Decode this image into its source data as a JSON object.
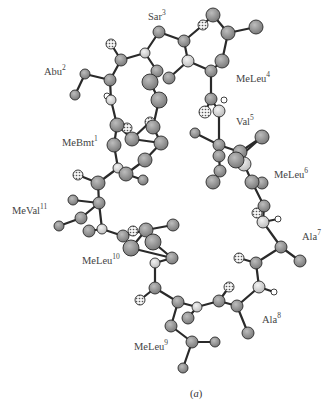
{
  "figure": {
    "caption_letter": "a",
    "caption_pos": [
      190,
      388
    ]
  },
  "colors": {
    "bond": "#2a2a2a",
    "carbon_fill": "#8c8c8c",
    "nitrogen_fill": "#d6d6d6",
    "oxygen_fill": "#f2f2f2",
    "hydrogen_fill": "#ffffff",
    "outline": "#2a2a2a",
    "label": "#444444"
  },
  "labels": [
    {
      "name": "Sar",
      "num": "3",
      "x": 148,
      "y": 12
    },
    {
      "name": "Abu",
      "num": "2",
      "x": 44,
      "y": 67
    },
    {
      "name": "MeLeu",
      "num": "4",
      "x": 236,
      "y": 74
    },
    {
      "name": "Val",
      "num": "5",
      "x": 236,
      "y": 117
    },
    {
      "name": "MeBmt",
      "num": "1",
      "x": 62,
      "y": 138
    },
    {
      "name": "MeLeu",
      "num": "6",
      "x": 274,
      "y": 170
    },
    {
      "name": "MeVal",
      "num": "11",
      "x": 12,
      "y": 206
    },
    {
      "name": "Ala",
      "num": "7",
      "x": 302,
      "y": 232
    },
    {
      "name": "MeLeu",
      "num": "10",
      "x": 82,
      "y": 256
    },
    {
      "name": "Ala",
      "num": "8",
      "x": 262,
      "y": 315
    },
    {
      "name": "MeLeu",
      "num": "9",
      "x": 134,
      "y": 342
    }
  ],
  "atoms": [
    {
      "id": "a1",
      "x": 159,
      "y": 32,
      "r": 6,
      "t": "C"
    },
    {
      "id": "a2",
      "x": 184,
      "y": 41,
      "r": 6,
      "t": "C"
    },
    {
      "id": "a3",
      "x": 203,
      "y": 25,
      "r": 5,
      "t": "O"
    },
    {
      "id": "a4",
      "x": 213,
      "y": 15,
      "r": 7,
      "t": "C"
    },
    {
      "id": "a5",
      "x": 228,
      "y": 33,
      "r": 7,
      "t": "C"
    },
    {
      "id": "a6",
      "x": 256,
      "y": 27,
      "r": 7,
      "t": "C"
    },
    {
      "id": "a7",
      "x": 222,
      "y": 61,
      "r": 7,
      "t": "C"
    },
    {
      "id": "a8",
      "x": 188,
      "y": 61,
      "r": 6,
      "t": "N"
    },
    {
      "id": "a9",
      "x": 169,
      "y": 78,
      "r": 6,
      "t": "C"
    },
    {
      "id": "a10",
      "x": 211,
      "y": 71,
      "r": 6,
      "t": "C"
    },
    {
      "id": "a11",
      "x": 145,
      "y": 53,
      "r": 5,
      "t": "N"
    },
    {
      "id": "a12",
      "x": 121,
      "y": 60,
      "r": 6,
      "t": "C"
    },
    {
      "id": "a13",
      "x": 111,
      "y": 44,
      "r": 5,
      "t": "O"
    },
    {
      "id": "a14",
      "x": 157,
      "y": 71,
      "r": 6,
      "t": "C"
    },
    {
      "id": "a15",
      "x": 150,
      "y": 82,
      "r": 8,
      "t": "C"
    },
    {
      "id": "a16",
      "x": 159,
      "y": 100,
      "r": 8,
      "t": "C"
    },
    {
      "id": "a17",
      "x": 110,
      "y": 80,
      "r": 6,
      "t": "C"
    },
    {
      "id": "a18",
      "x": 85,
      "y": 74,
      "r": 5,
      "t": "C"
    },
    {
      "id": "a19",
      "x": 75,
      "y": 95,
      "r": 5,
      "t": "C"
    },
    {
      "id": "a20",
      "x": 111,
      "y": 100,
      "r": 5,
      "t": "N"
    },
    {
      "id": "a21",
      "x": 107,
      "y": 96,
      "r": 3,
      "t": "H"
    },
    {
      "id": "a22",
      "x": 211,
      "y": 99,
      "r": 6,
      "t": "C"
    },
    {
      "id": "a23",
      "x": 205,
      "y": 112,
      "r": 6,
      "t": "O"
    },
    {
      "id": "a24",
      "x": 219,
      "y": 111,
      "r": 6,
      "t": "N"
    },
    {
      "id": "a25",
      "x": 224,
      "y": 100,
      "r": 3,
      "t": "H"
    },
    {
      "id": "a26",
      "x": 117,
      "y": 125,
      "r": 7,
      "t": "C"
    },
    {
      "id": "a27",
      "x": 127,
      "y": 128,
      "r": 5,
      "t": "O"
    },
    {
      "id": "a28",
      "x": 150,
      "y": 122,
      "r": 5,
      "t": "O"
    },
    {
      "id": "a29",
      "x": 153,
      "y": 127,
      "r": 7,
      "t": "C"
    },
    {
      "id": "a30",
      "x": 114,
      "y": 145,
      "r": 7,
      "t": "C"
    },
    {
      "id": "a31",
      "x": 132,
      "y": 139,
      "r": 7,
      "t": "C"
    },
    {
      "id": "a32",
      "x": 161,
      "y": 143,
      "r": 7,
      "t": "C"
    },
    {
      "id": "a33",
      "x": 145,
      "y": 160,
      "r": 7,
      "t": "C"
    },
    {
      "id": "a34",
      "x": 118,
      "y": 168,
      "r": 5,
      "t": "N"
    },
    {
      "id": "a35",
      "x": 126,
      "y": 174,
      "r": 7,
      "t": "C"
    },
    {
      "id": "a36",
      "x": 143,
      "y": 180,
      "r": 5,
      "t": "C"
    },
    {
      "id": "a37",
      "x": 98,
      "y": 183,
      "r": 7,
      "t": "C"
    },
    {
      "id": "a38",
      "x": 78,
      "y": 175,
      "r": 5,
      "t": "O"
    },
    {
      "id": "a39",
      "x": 99,
      "y": 203,
      "r": 6,
      "t": "C"
    },
    {
      "id": "a40",
      "x": 73,
      "y": 200,
      "r": 5,
      "t": "C"
    },
    {
      "id": "a41",
      "x": 81,
      "y": 218,
      "r": 6,
      "t": "C"
    },
    {
      "id": "a42",
      "x": 59,
      "y": 226,
      "r": 5,
      "t": "C"
    },
    {
      "id": "a43",
      "x": 102,
      "y": 229,
      "r": 5,
      "t": "N"
    },
    {
      "id": "a44",
      "x": 89,
      "y": 231,
      "r": 6,
      "t": "C"
    },
    {
      "id": "a45",
      "x": 123,
      "y": 236,
      "r": 6,
      "t": "C"
    },
    {
      "id": "a46",
      "x": 133,
      "y": 231,
      "r": 5,
      "t": "O"
    },
    {
      "id": "a47",
      "x": 146,
      "y": 230,
      "r": 7,
      "t": "C"
    },
    {
      "id": "a48",
      "x": 131,
      "y": 248,
      "r": 8,
      "t": "C"
    },
    {
      "id": "a49",
      "x": 153,
      "y": 242,
      "r": 8,
      "t": "C"
    },
    {
      "id": "a50",
      "x": 173,
      "y": 225,
      "r": 6,
      "t": "C"
    },
    {
      "id": "a51",
      "x": 172,
      "y": 258,
      "r": 6,
      "t": "C"
    },
    {
      "id": "a52",
      "x": 155,
      "y": 263,
      "r": 5,
      "t": "N"
    },
    {
      "id": "a53",
      "x": 155,
      "y": 288,
      "r": 6,
      "t": "C"
    },
    {
      "id": "a54",
      "x": 140,
      "y": 300,
      "r": 5,
      "t": "O"
    },
    {
      "id": "a55",
      "x": 178,
      "y": 302,
      "r": 6,
      "t": "C"
    },
    {
      "id": "a56",
      "x": 171,
      "y": 326,
      "r": 6,
      "t": "C"
    },
    {
      "id": "a57",
      "x": 192,
      "y": 342,
      "r": 6,
      "t": "C"
    },
    {
      "id": "a58",
      "x": 215,
      "y": 342,
      "r": 5,
      "t": "C"
    },
    {
      "id": "a59",
      "x": 183,
      "y": 368,
      "r": 5,
      "t": "C"
    },
    {
      "id": "a60",
      "x": 197,
      "y": 307,
      "r": 5,
      "t": "N"
    },
    {
      "id": "a61",
      "x": 188,
      "y": 318,
      "r": 6,
      "t": "C"
    },
    {
      "id": "a62",
      "x": 219,
      "y": 301,
      "r": 6,
      "t": "C"
    },
    {
      "id": "a63",
      "x": 229,
      "y": 287,
      "r": 5,
      "t": "O"
    },
    {
      "id": "a64",
      "x": 237,
      "y": 306,
      "r": 6,
      "t": "C"
    },
    {
      "id": "a65",
      "x": 248,
      "y": 333,
      "r": 6,
      "t": "C"
    },
    {
      "id": "a66",
      "x": 259,
      "y": 287,
      "r": 6,
      "t": "N"
    },
    {
      "id": "a67",
      "x": 274,
      "y": 292,
      "r": 3,
      "t": "H"
    },
    {
      "id": "a68",
      "x": 256,
      "y": 263,
      "r": 6,
      "t": "C"
    },
    {
      "id": "a69",
      "x": 239,
      "y": 258,
      "r": 5,
      "t": "O"
    },
    {
      "id": "a70",
      "x": 281,
      "y": 247,
      "r": 6,
      "t": "C"
    },
    {
      "id": "a71",
      "x": 300,
      "y": 261,
      "r": 6,
      "t": "C"
    },
    {
      "id": "a72",
      "x": 263,
      "y": 222,
      "r": 6,
      "t": "N"
    },
    {
      "id": "a73",
      "x": 278,
      "y": 219,
      "r": 3,
      "t": "H"
    },
    {
      "id": "a74",
      "x": 264,
      "y": 206,
      "r": 6,
      "t": "C"
    },
    {
      "id": "a75",
      "x": 257,
      "y": 213,
      "r": 5,
      "t": "O"
    },
    {
      "id": "a76",
      "x": 252,
      "y": 182,
      "r": 7,
      "t": "C"
    },
    {
      "id": "a77",
      "x": 262,
      "y": 183,
      "r": 6,
      "t": "C"
    },
    {
      "id": "a78",
      "x": 219,
      "y": 145,
      "r": 6,
      "t": "C"
    },
    {
      "id": "a79",
      "x": 195,
      "y": 133,
      "r": 5,
      "t": "C"
    },
    {
      "id": "a80",
      "x": 262,
      "y": 137,
      "r": 7,
      "t": "C"
    },
    {
      "id": "a81",
      "x": 240,
      "y": 152,
      "r": 7,
      "t": "C"
    },
    {
      "id": "a82",
      "x": 244,
      "y": 164,
      "r": 7,
      "t": "N"
    },
    {
      "id": "a83",
      "x": 236,
      "y": 160,
      "r": 8,
      "t": "C"
    },
    {
      "id": "a84",
      "x": 220,
      "y": 171,
      "r": 6,
      "t": "C"
    },
    {
      "id": "a85",
      "x": 213,
      "y": 182,
      "r": 7,
      "t": "C"
    },
    {
      "id": "a86",
      "x": 219,
      "y": 156,
      "r": 6,
      "t": "C"
    }
  ],
  "bonds": [
    [
      "a1",
      "a2"
    ],
    [
      "a2",
      "a3"
    ],
    [
      "a3",
      "a4"
    ],
    [
      "a4",
      "a5"
    ],
    [
      "a5",
      "a6"
    ],
    [
      "a5",
      "a7"
    ],
    [
      "a7",
      "a10"
    ],
    [
      "a2",
      "a8"
    ],
    [
      "a8",
      "a9"
    ],
    [
      "a8",
      "a10"
    ],
    [
      "a1",
      "a11"
    ],
    [
      "a11",
      "a12"
    ],
    [
      "a12",
      "a13"
    ],
    [
      "a11",
      "a14"
    ],
    [
      "a14",
      "a15"
    ],
    [
      "a15",
      "a16"
    ],
    [
      "a12",
      "a17"
    ],
    [
      "a17",
      "a18"
    ],
    [
      "a18",
      "a19"
    ],
    [
      "a17",
      "a20"
    ],
    [
      "a10",
      "a22"
    ],
    [
      "a22",
      "a23"
    ],
    [
      "a22",
      "a24"
    ],
    [
      "a24",
      "a78"
    ],
    [
      "a20",
      "a26"
    ],
    [
      "a26",
      "a30"
    ],
    [
      "a26",
      "a31"
    ],
    [
      "a31",
      "a32"
    ],
    [
      "a31",
      "a28"
    ],
    [
      "a28",
      "a29"
    ],
    [
      "a16",
      "a29"
    ],
    [
      "a29",
      "a32"
    ],
    [
      "a32",
      "a33"
    ],
    [
      "a33",
      "a35"
    ],
    [
      "a30",
      "a34"
    ],
    [
      "a34",
      "a35"
    ],
    [
      "a35",
      "a36"
    ],
    [
      "a34",
      "a37"
    ],
    [
      "a37",
      "a38"
    ],
    [
      "a37",
      "a39"
    ],
    [
      "a39",
      "a40"
    ],
    [
      "a39",
      "a41"
    ],
    [
      "a41",
      "a42"
    ],
    [
      "a39",
      "a43"
    ],
    [
      "a43",
      "a44"
    ],
    [
      "a43",
      "a45"
    ],
    [
      "a45",
      "a46"
    ],
    [
      "a45",
      "a47"
    ],
    [
      "a47",
      "a48"
    ],
    [
      "a47",
      "a49"
    ],
    [
      "a47",
      "a50"
    ],
    [
      "a48",
      "a51"
    ],
    [
      "a49",
      "a51"
    ],
    [
      "a51",
      "a52"
    ],
    [
      "a52",
      "a53"
    ],
    [
      "a53",
      "a54"
    ],
    [
      "a53",
      "a55"
    ],
    [
      "a55",
      "a56"
    ],
    [
      "a56",
      "a57"
    ],
    [
      "a57",
      "a58"
    ],
    [
      "a57",
      "a59"
    ],
    [
      "a55",
      "a60"
    ],
    [
      "a60",
      "a61"
    ],
    [
      "a60",
      "a62"
    ],
    [
      "a62",
      "a63"
    ],
    [
      "a62",
      "a64"
    ],
    [
      "a64",
      "a65"
    ],
    [
      "a64",
      "a66"
    ],
    [
      "a66",
      "a67"
    ],
    [
      "a66",
      "a68"
    ],
    [
      "a68",
      "a69"
    ],
    [
      "a68",
      "a70"
    ],
    [
      "a70",
      "a71"
    ],
    [
      "a70",
      "a72"
    ],
    [
      "a72",
      "a73"
    ],
    [
      "a72",
      "a74"
    ],
    [
      "a74",
      "a75"
    ],
    [
      "a74",
      "a76"
    ],
    [
      "a76",
      "a77"
    ],
    [
      "a78",
      "a79"
    ],
    [
      "a78",
      "a86"
    ],
    [
      "a78",
      "a81"
    ],
    [
      "a81",
      "a80"
    ],
    [
      "a81",
      "a83"
    ],
    [
      "a83",
      "a82"
    ],
    [
      "a82",
      "a76"
    ],
    [
      "a86",
      "a84"
    ],
    [
      "a84",
      "a85"
    ],
    [
      "a83",
      "a80"
    ]
  ]
}
